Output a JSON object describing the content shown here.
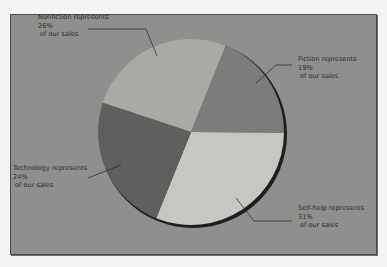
{
  "chart_data": {
    "type": "pie",
    "title": "",
    "start_angle_deg": 22,
    "direction": "clockwise",
    "slices": [
      {
        "label": "Fiction",
        "value": 19,
        "color": "#7c7c7a",
        "annotation": [
          "Fiction represents",
          "19%",
          " of our sales"
        ],
        "placement": "right"
      },
      {
        "label": "Self-help",
        "value": 31,
        "color": "#c6c6c3",
        "annotation": [
          "Self-help represents",
          "31%",
          " of our sales"
        ],
        "placement": "bottom-right"
      },
      {
        "label": "Technology",
        "value": 24,
        "color": "#5f5f5d",
        "annotation": [
          "Technology represents",
          "24%",
          " of our sales"
        ],
        "placement": "left"
      },
      {
        "label": "Nonfiction",
        "value": 26,
        "color": "#a9a9a6",
        "annotation": [
          "Nonfiction represents",
          "26%",
          " of our sales"
        ],
        "placement": "top-left"
      }
    ],
    "legend": "none"
  }
}
